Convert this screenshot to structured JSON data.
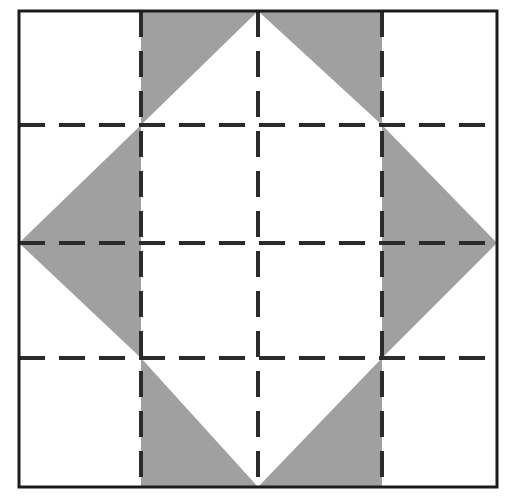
{
  "figure": {
    "title": "Nine-patch quilt block with inscribed shaded diamond",
    "canvas": {
      "width": 512,
      "height": 500,
      "background": "#ffffff"
    },
    "frame": {
      "label": "outer square frame",
      "x": 19,
      "y": 11,
      "width": 478,
      "height": 476,
      "stroke_color": "#1c1c1c",
      "stroke_width": 3,
      "fill": "none"
    },
    "grid": {
      "label": "dashed nine-patch grid",
      "stroke_color": "#2b2b2b",
      "stroke_width": 4,
      "dash_length": 26,
      "gap_length": 14,
      "vertical_lines_x": [
        141,
        258,
        382
      ],
      "horizontal_lines_y": [
        125,
        243,
        358
      ],
      "rows": 3,
      "columns": 3
    },
    "diamond": {
      "label": "shaded diamond",
      "fill_color": "#a0a0a0",
      "vertices": [
        {
          "name": "top",
          "x": 258,
          "y": 11
        },
        {
          "name": "right",
          "x": 497,
          "y": 243
        },
        {
          "name": "bottom",
          "x": 258,
          "y": 487
        },
        {
          "name": "left",
          "x": 19,
          "y": 243
        }
      ]
    },
    "inner_square": {
      "label": "white center square cut-out",
      "fill_color": "#ffffff",
      "x": 141,
      "y": 125,
      "width": 241,
      "height": 233
    },
    "shaded_triangles": [
      {
        "name": "top-left shaded triangle",
        "points": "258,11 141,125 141,11"
      },
      {
        "name": "top-right shaded triangle",
        "points": "258,11 382,125 382,11"
      },
      {
        "name": "upper-left wing triangle",
        "points": "19,243 141,125 141,243"
      },
      {
        "name": "upper-right wing triangle",
        "points": "497,243 382,125 382,243"
      },
      {
        "name": "lower-left wing triangle",
        "points": "19,243 141,358 141,243"
      },
      {
        "name": "lower-right wing triangle",
        "points": "497,243 382,358 382,243"
      },
      {
        "name": "bottom-left shaded triangle",
        "points": "258,487 141,358 141,487"
      },
      {
        "name": "bottom-right shaded triangle",
        "points": "258,487 382,358 382,487"
      }
    ],
    "colors": {
      "shade": "#a0a0a0",
      "ink": "#1c1c1c",
      "dash": "#2b2b2b",
      "paper": "#ffffff"
    }
  }
}
